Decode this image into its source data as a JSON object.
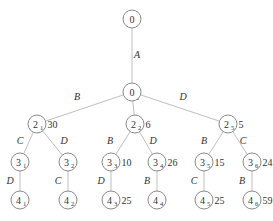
{
  "diagram": {
    "type": "tree",
    "nodes": [
      {
        "id": "root",
        "label": "0",
        "sub": "",
        "x": 132,
        "y": 19,
        "value": ""
      },
      {
        "id": "n0",
        "label": "0",
        "sub": "",
        "x": 132,
        "y": 92,
        "value": ""
      },
      {
        "id": "n2_1",
        "label": "2",
        "sub": "1",
        "x": 37,
        "y": 124,
        "value": "30"
      },
      {
        "id": "n2_2",
        "label": "2",
        "sub": "2",
        "x": 135,
        "y": 124,
        "value": "6"
      },
      {
        "id": "n2_5",
        "label": "2",
        "sub": "5",
        "x": 228,
        "y": 124,
        "value": "5"
      },
      {
        "id": "n3_1",
        "label": "3",
        "sub": "1",
        "x": 20,
        "y": 162,
        "value": ""
      },
      {
        "id": "n3_2",
        "label": "3",
        "sub": "2",
        "x": 68,
        "y": 162,
        "value": ""
      },
      {
        "id": "n3_3",
        "label": "3",
        "sub": "3",
        "x": 111,
        "y": 162,
        "value": "10"
      },
      {
        "id": "n3_4",
        "label": "3",
        "sub": "4",
        "x": 157,
        "y": 162,
        "value": "26"
      },
      {
        "id": "n3_5",
        "label": "3",
        "sub": "5",
        "x": 204,
        "y": 162,
        "value": "15"
      },
      {
        "id": "n3_6",
        "label": "3",
        "sub": "6",
        "x": 252,
        "y": 162,
        "value": "24"
      },
      {
        "id": "n4_1",
        "label": "4",
        "sub": "1",
        "x": 20,
        "y": 200,
        "value": ""
      },
      {
        "id": "n4_2",
        "label": "4",
        "sub": "2",
        "x": 68,
        "y": 200,
        "value": ""
      },
      {
        "id": "n4_3",
        "label": "4",
        "sub": "3",
        "x": 111,
        "y": 200,
        "value": "25"
      },
      {
        "id": "n4_4",
        "label": "4",
        "sub": "4",
        "x": 157,
        "y": 200,
        "value": ""
      },
      {
        "id": "n4_5",
        "label": "4",
        "sub": "5",
        "x": 204,
        "y": 200,
        "value": "25"
      },
      {
        "id": "n4_6",
        "label": "4",
        "sub": "6",
        "x": 252,
        "y": 200,
        "value": "59"
      }
    ],
    "edges": [
      {
        "from": "root",
        "to": "n0",
        "label": "A",
        "lx": 137,
        "ly": 58
      },
      {
        "from": "n0",
        "to": "n2_1",
        "label": "B",
        "lx": 77,
        "ly": 100
      },
      {
        "from": "n0",
        "to": "n2_2",
        "label": "C",
        "lx": 136,
        "ly": 100
      },
      {
        "from": "n0",
        "to": "n2_5",
        "label": "D",
        "lx": 183,
        "ly": 100
      },
      {
        "from": "n2_1",
        "to": "n3_1",
        "label": "C",
        "lx": 20,
        "ly": 144
      },
      {
        "from": "n2_1",
        "to": "n3_2",
        "label": "D",
        "lx": 64,
        "ly": 144
      },
      {
        "from": "n2_2",
        "to": "n3_3",
        "label": "B",
        "lx": 110,
        "ly": 144
      },
      {
        "from": "n2_2",
        "to": "n3_4",
        "label": "D",
        "lx": 153,
        "ly": 144
      },
      {
        "from": "n2_5",
        "to": "n3_5",
        "label": "B",
        "lx": 204,
        "ly": 144
      },
      {
        "from": "n2_5",
        "to": "n3_6",
        "label": "C",
        "lx": 243,
        "ly": 144
      },
      {
        "from": "n3_1",
        "to": "n4_1",
        "label": "D",
        "lx": 10,
        "ly": 184
      },
      {
        "from": "n3_2",
        "to": "n4_2",
        "label": "C",
        "lx": 58,
        "ly": 184
      },
      {
        "from": "n3_3",
        "to": "n4_3",
        "label": "D",
        "lx": 101,
        "ly": 184
      },
      {
        "from": "n3_4",
        "to": "n4_4",
        "label": "B",
        "lx": 147,
        "ly": 184
      },
      {
        "from": "n3_5",
        "to": "n4_5",
        "label": "C",
        "lx": 194,
        "ly": 184
      },
      {
        "from": "n3_6",
        "to": "n4_6",
        "label": "B",
        "lx": 242,
        "ly": 184
      }
    ]
  }
}
